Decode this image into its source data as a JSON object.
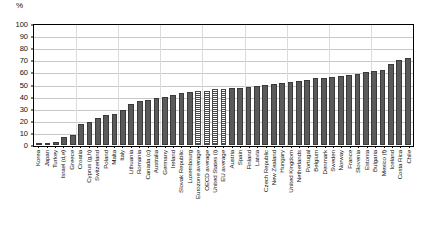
{
  "chart_data": {
    "type": "bar",
    "title": "",
    "subtitle": "",
    "xlabel": "",
    "ylabel": "%",
    "unit_label": "%",
    "ylim": [
      0,
      100
    ],
    "yticks": [
      0,
      10,
      20,
      30,
      40,
      50,
      60,
      70,
      80,
      90,
      100
    ],
    "grid": true,
    "legend": "none",
    "series_name": "Share (%)",
    "categories": [
      "Korea",
      "Japan",
      "Turkey",
      "Israel (d,e)",
      "Greece",
      "Croatia",
      "Cyprus (g,h)",
      "Switzerland",
      "Poland",
      "Malta",
      "Italy",
      "Lithuania",
      "Romania",
      "Canada (c)",
      "Australia",
      "Germany",
      "Ireland",
      "Slovak Republic",
      "Luxembourg",
      "Eurozone average",
      "OECD average",
      "United States (i)",
      "EU average",
      "Austria",
      "Spain",
      "Finland",
      "Latvia",
      "Czech Republic",
      "New Zealand",
      "Hungary",
      "United Kingdom",
      "Netherlands",
      "Portugal",
      "Belgium",
      "Denmark",
      "Sweden",
      "Norway",
      "France",
      "Slovenia",
      "Estonia",
      "Bulgaria",
      "Mexico (f)",
      "Iceland",
      "Costa Rica",
      "Chile"
    ],
    "values": [
      1.5,
      2,
      2.5,
      6.5,
      8.5,
      17.5,
      19,
      22,
      24.5,
      26,
      29,
      34,
      36,
      37,
      39,
      40,
      41,
      43,
      44,
      45,
      45,
      46,
      46,
      47,
      47.5,
      48,
      49,
      50,
      50.5,
      51.5,
      52,
      53,
      54,
      55,
      55.5,
      56,
      57,
      58,
      59,
      60,
      61,
      62,
      67,
      70,
      72
    ],
    "highlighted_categories": [
      "Eurozone average",
      "OECD average",
      "United States (i)",
      "EU average"
    ],
    "bar_color": "#5a5a5a",
    "highlight_pattern": "hatched"
  }
}
